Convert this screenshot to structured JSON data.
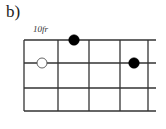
{
  "figure": {
    "label": "b)",
    "fret_label": "10fr"
  },
  "fretboard": {
    "strings_visible": 4,
    "frets_visible": 4,
    "line_color": "#333333",
    "grid": {
      "x_lines": [
        24,
        58,
        89,
        120,
        148
      ],
      "y_lines": [
        40,
        63,
        88,
        111
      ],
      "line_extend_right": 156
    },
    "markers": [
      {
        "type": "filled",
        "string": 1,
        "fret": 2,
        "x": 74,
        "y": 40,
        "color": "#000000"
      },
      {
        "type": "open",
        "string": 2,
        "fret": 1,
        "x": 42,
        "y": 63,
        "color": "#ffffff"
      },
      {
        "type": "filled",
        "string": 2,
        "fret": 4,
        "x": 134,
        "y": 63,
        "color": "#000000"
      }
    ]
  }
}
